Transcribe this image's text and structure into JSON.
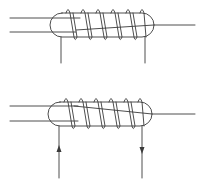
{
  "diagram": {
    "stroke_color": "#3a3a3a",
    "background": "#ffffff",
    "coils": [
      {
        "name": "top-coil",
        "turns": 6,
        "capsule": {
          "x": 50,
          "y": 13,
          "w": 104,
          "h": 24
        },
        "leads": {
          "left_x": 61,
          "right_x": 145,
          "bottom_y": 63
        },
        "arrows": []
      },
      {
        "name": "bottom-coil",
        "turns": 6,
        "capsule": {
          "x": 48,
          "y": 102,
          "w": 104,
          "h": 24
        },
        "leads": {
          "left_x": 59,
          "right_x": 142,
          "bottom_y": 178
        },
        "arrows": [
          {
            "side": "left",
            "direction": "up",
            "y": 149
          },
          {
            "side": "right",
            "direction": "down",
            "y": 150
          }
        ]
      }
    ]
  }
}
